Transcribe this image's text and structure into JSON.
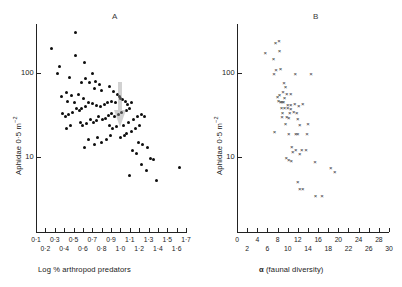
{
  "figure": {
    "background": "#ffffff",
    "marker_color_a": "#0d0d0d",
    "marker_color_b": "#2b2b2b",
    "axis_color": "#222222"
  },
  "panel_a": {
    "label": "A",
    "ylabel_main": "Aphidae 0",
    "ylabel_mid": "·",
    "ylabel_rest": "5 m",
    "ylabel_exp": "−2",
    "xlabel": "Log % arthropod predators",
    "ytick_labels": [
      "100",
      "10"
    ],
    "xtick_labels_top": [
      "0·1",
      "0·3",
      "0·5",
      "0·7",
      "0·9",
      "1·1",
      "1·3",
      "1·5",
      "1·7"
    ],
    "xtick_labels_bottom": [
      "0·2",
      "0·4",
      "0·6",
      "0·8",
      "1·0",
      "1·2",
      "1·4",
      "1·6"
    ]
  },
  "panel_b": {
    "label": "B",
    "ylabel_main": "Aphidae 0",
    "ylabel_mid": "·",
    "ylabel_rest": "5 m",
    "ylabel_exp": "−2",
    "xlabel_symbol": "α",
    "xlabel_rest": " (faunal diversity)",
    "ytick_labels": [
      "100",
      "10"
    ],
    "xtick_labels_top": [
      "0",
      "4",
      "8",
      "12",
      "16",
      "20",
      "24",
      "28"
    ],
    "xtick_labels_bottom": [
      "2",
      "6",
      "10",
      "14",
      "18",
      "22",
      "26",
      "30"
    ]
  },
  "chart_data": [
    {
      "type": "scatter",
      "panel": "A",
      "title": "A",
      "xlabel": "Log % arthropod predators",
      "ylabel": "Aphidae 0·5 m⁻²",
      "yscale": "log",
      "xlim": [
        0.1,
        1.7
      ],
      "ylim": [
        3,
        400
      ],
      "xticks": [
        0.1,
        0.2,
        0.3,
        0.4,
        0.5,
        0.6,
        0.7,
        0.8,
        0.9,
        1.0,
        1.1,
        1.2,
        1.3,
        1.4,
        1.5,
        1.6,
        1.7
      ],
      "yticks": [
        10,
        100
      ],
      "grid": false,
      "legend": "none",
      "marker": "filled-circle",
      "n_points": 95,
      "points": [
        [
          0.52,
          300
        ],
        [
          0.27,
          195
        ],
        [
          0.52,
          160
        ],
        [
          0.62,
          135
        ],
        [
          0.35,
          118
        ],
        [
          0.33,
          100
        ],
        [
          0.7,
          98
        ],
        [
          0.46,
          88
        ],
        [
          0.63,
          86
        ],
        [
          0.58,
          78
        ],
        [
          0.67,
          77
        ],
        [
          0.73,
          80
        ],
        [
          0.78,
          72
        ],
        [
          0.72,
          66
        ],
        [
          0.88,
          70
        ],
        [
          0.8,
          62
        ],
        [
          0.42,
          58
        ],
        [
          0.48,
          54
        ],
        [
          0.55,
          56
        ],
        [
          0.61,
          50
        ],
        [
          0.37,
          52
        ],
        [
          0.44,
          46
        ],
        [
          0.51,
          44
        ],
        [
          0.93,
          60
        ],
        [
          0.97,
          56
        ],
        [
          0.99,
          52
        ],
        [
          1.0,
          50
        ],
        [
          1.02,
          48
        ],
        [
          0.9,
          46
        ],
        [
          0.86,
          44
        ],
        [
          0.83,
          42
        ],
        [
          0.79,
          40
        ],
        [
          0.75,
          41
        ],
        [
          0.7,
          43
        ],
        [
          0.66,
          45
        ],
        [
          0.63,
          40
        ],
        [
          0.59,
          38
        ],
        [
          0.56,
          36
        ],
        [
          0.53,
          38
        ],
        [
          0.49,
          34
        ],
        [
          0.45,
          32
        ],
        [
          0.41,
          30
        ],
        [
          0.38,
          33
        ],
        [
          0.95,
          44
        ],
        [
          1.05,
          46
        ],
        [
          1.08,
          42
        ],
        [
          1.12,
          44
        ],
        [
          1.1,
          38
        ],
        [
          1.06,
          36
        ],
        [
          1.01,
          34
        ],
        [
          0.98,
          32
        ],
        [
          0.94,
          30
        ],
        [
          0.91,
          33
        ],
        [
          0.87,
          31
        ],
        [
          0.84,
          29
        ],
        [
          0.81,
          28
        ],
        [
          0.77,
          30
        ],
        [
          0.74,
          27
        ],
        [
          0.71,
          26
        ],
        [
          0.68,
          28
        ],
        [
          0.64,
          25
        ],
        [
          0.6,
          24
        ],
        [
          0.57,
          26
        ],
        [
          0.47,
          24
        ],
        [
          0.43,
          22
        ],
        [
          0.88,
          24
        ],
        [
          0.92,
          22
        ],
        [
          0.96,
          23
        ],
        [
          1.03,
          24
        ],
        [
          1.09,
          26
        ],
        [
          1.14,
          28
        ],
        [
          1.18,
          30
        ],
        [
          1.22,
          32
        ],
        [
          1.26,
          30
        ],
        [
          1.2,
          24
        ],
        [
          1.16,
          22
        ],
        [
          1.12,
          20
        ],
        [
          1.07,
          19
        ],
        [
          1.04,
          18
        ],
        [
          1.0,
          17
        ],
        [
          0.89,
          18
        ],
        [
          0.85,
          16
        ],
        [
          0.8,
          15
        ],
        [
          0.76,
          17
        ],
        [
          0.72,
          14
        ],
        [
          0.66,
          16
        ],
        [
          0.62,
          13
        ],
        [
          1.19,
          15
        ],
        [
          1.24,
          14
        ],
        [
          1.29,
          13
        ],
        [
          1.13,
          12
        ],
        [
          1.17,
          11
        ],
        [
          1.32,
          9.5
        ],
        [
          1.35,
          9.4
        ],
        [
          1.23,
          8.2
        ],
        [
          1.28,
          7.0
        ],
        [
          1.63,
          7.5
        ],
        [
          1.1,
          6.0
        ],
        [
          1.38,
          5.2
        ]
      ]
    },
    {
      "type": "scatter",
      "panel": "B",
      "title": "B",
      "xlabel": "α (faunal diversity)",
      "ylabel": "Aphidae 0·5 m⁻²",
      "yscale": "log",
      "xlim": [
        0,
        30
      ],
      "ylim": [
        3,
        400
      ],
      "xticks": [
        0,
        2,
        4,
        6,
        8,
        10,
        12,
        14,
        16,
        18,
        20,
        22,
        24,
        26,
        28,
        30
      ],
      "yticks": [
        10,
        100
      ],
      "grid": false,
      "legend": "none",
      "marker": "x",
      "n_points": 64,
      "points": [
        [
          7.6,
          225
        ],
        [
          8.3,
          240
        ],
        [
          8.4,
          185
        ],
        [
          5.6,
          175
        ],
        [
          7.2,
          145
        ],
        [
          7.7,
          108
        ],
        [
          8.6,
          112
        ],
        [
          7.3,
          98
        ],
        [
          11.5,
          97
        ],
        [
          14.6,
          97
        ],
        [
          9.3,
          76
        ],
        [
          9.6,
          68
        ],
        [
          9.1,
          60
        ],
        [
          8.4,
          55
        ],
        [
          8.0,
          52
        ],
        [
          9.8,
          56
        ],
        [
          10.6,
          56
        ],
        [
          8.2,
          46
        ],
        [
          8.6,
          45
        ],
        [
          8.9,
          45
        ],
        [
          9.2,
          45
        ],
        [
          10.0,
          42
        ],
        [
          10.6,
          42
        ],
        [
          11.4,
          43
        ],
        [
          12.2,
          41
        ],
        [
          8.8,
          38
        ],
        [
          9.4,
          38
        ],
        [
          10.0,
          38
        ],
        [
          10.6,
          37
        ],
        [
          8.9,
          30
        ],
        [
          9.8,
          30
        ],
        [
          10.2,
          29
        ],
        [
          12.0,
          28
        ],
        [
          9.6,
          25
        ],
        [
          12.4,
          24
        ],
        [
          7.4,
          20
        ],
        [
          10.2,
          19
        ],
        [
          11.6,
          19
        ],
        [
          12.0,
          19
        ],
        [
          13.8,
          19
        ],
        [
          10.8,
          13
        ],
        [
          11.0,
          11.5
        ],
        [
          11.6,
          12
        ],
        [
          12.4,
          11
        ],
        [
          12.8,
          12
        ],
        [
          13.6,
          12
        ],
        [
          9.7,
          9.8
        ],
        [
          10.2,
          9.2
        ],
        [
          10.7,
          9.0
        ],
        [
          15.4,
          8.8
        ],
        [
          18.5,
          7.4
        ],
        [
          19.3,
          6.6
        ],
        [
          12.0,
          5.0
        ],
        [
          12.4,
          4.2
        ],
        [
          13.0,
          4.2
        ],
        [
          15.5,
          3.4
        ],
        [
          16.8,
          3.4
        ],
        [
          11.2,
          34
        ],
        [
          11.8,
          33
        ],
        [
          10.4,
          33
        ],
        [
          9.0,
          33
        ],
        [
          13.0,
          43
        ],
        [
          9.4,
          51
        ],
        [
          14.0,
          25
        ]
      ]
    }
  ]
}
